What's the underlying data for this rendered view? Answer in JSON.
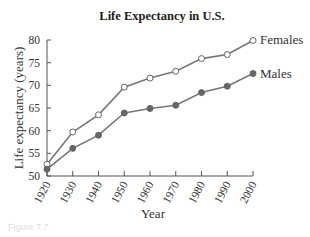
{
  "chart_data": {
    "type": "line",
    "title": "Life Expectancy in U.S.",
    "xlabel": "Year",
    "ylabel": "Life expectancy (years)",
    "x": [
      1920,
      1930,
      1940,
      1950,
      1960,
      1970,
      1980,
      1990,
      2000
    ],
    "x_tick_labels": [
      "1920",
      "1930",
      "1940",
      "1950",
      "1960",
      "1970",
      "1980",
      "1990",
      "2000"
    ],
    "y_tick_labels": [
      "50",
      "55",
      "60",
      "65",
      "70",
      "75",
      "80"
    ],
    "ylim": [
      50,
      80
    ],
    "grid": false,
    "legend_position": "inline-right",
    "series": [
      {
        "name": "Females",
        "marker": "open-circle",
        "values": [
          52.6,
          59.7,
          63.5,
          69.6,
          71.6,
          73.1,
          75.9,
          76.8,
          79.9
        ]
      },
      {
        "name": "Males",
        "marker": "filled-circle",
        "values": [
          51.5,
          56.1,
          59.0,
          63.9,
          64.9,
          65.6,
          68.4,
          69.8,
          72.6
        ]
      }
    ]
  },
  "caption": "Figure 7.7"
}
